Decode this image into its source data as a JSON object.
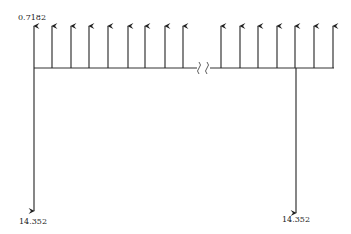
{
  "diagram": {
    "type": "cash-flow",
    "top_label": "0.7182",
    "bottom_left_label": "14.352",
    "bottom_right_label": "14.352",
    "up_arrows_left_x": [
      34,
      52,
      71,
      89,
      108,
      128,
      145,
      165,
      183
    ],
    "up_arrows_right_x": [
      221,
      240,
      258,
      277,
      295,
      314,
      333
    ],
    "down_arrows_x": [
      34,
      296
    ],
    "line_color": "#222222"
  }
}
